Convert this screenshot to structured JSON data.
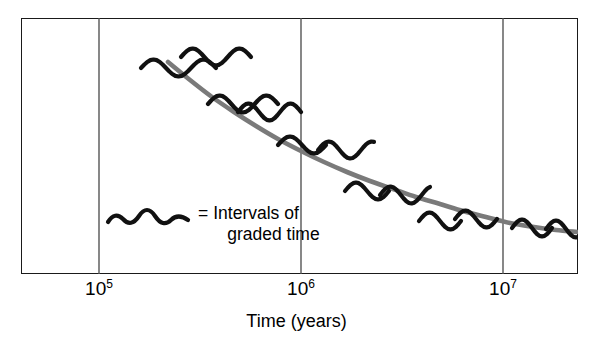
{
  "figure": {
    "background_color": "#ffffff",
    "frame_color": "#1a1a1a",
    "gridline_color": "#555555",
    "curve_color": "#7a7a7a",
    "squiggle_color": "#111111"
  },
  "axis": {
    "title": "Time (years)",
    "ticks": [
      {
        "mantissa": "10",
        "exponent": "5",
        "value": 100000,
        "x_px": 99
      },
      {
        "mantissa": "10",
        "exponent": "6",
        "value": 1000000,
        "x_px": 301
      },
      {
        "mantissa": "10",
        "exponent": "7",
        "value": 10000000,
        "x_px": 503
      }
    ]
  },
  "legend": {
    "equals": "=",
    "line1": "Intervals of",
    "line2": "graded time",
    "symbol_name": "wavy-squiggle"
  },
  "chart_data": {
    "type": "line",
    "title": "",
    "xlabel": "Time (years)",
    "ylabel": "",
    "x_scale": "log",
    "xlim": [
      30000,
      30000000
    ],
    "ylim": [
      0,
      1
    ],
    "grid": true,
    "gridlines_x": [
      100000,
      1000000,
      10000000
    ],
    "legend_position": "inside-lower-left",
    "series": [
      {
        "name": "rate-decay-curve",
        "color": "#7a7a7a",
        "points_px": [
          [
            168,
            62
          ],
          [
            190,
            80
          ],
          [
            212,
            97
          ],
          [
            234,
            112
          ],
          [
            256,
            126
          ],
          [
            278,
            139
          ],
          [
            301,
            151
          ],
          [
            324,
            162
          ],
          [
            347,
            172
          ],
          [
            370,
            181
          ],
          [
            393,
            189
          ],
          [
            416,
            197
          ],
          [
            440,
            204
          ],
          [
            463,
            211
          ],
          [
            486,
            217
          ],
          [
            510,
            223
          ],
          [
            534,
            227
          ],
          [
            556,
            230
          ],
          [
            577,
            232
          ]
        ]
      }
    ],
    "annotations": [
      {
        "name": "squiggle-1",
        "x_px": 141,
        "y_px": 68,
        "width_px": 75,
        "cycles": 1.5
      },
      {
        "name": "squiggle-2",
        "x_px": 181,
        "y_px": 57,
        "width_px": 70,
        "cycles": 1.5
      },
      {
        "name": "squiggle-3",
        "x_px": 208,
        "y_px": 104,
        "width_px": 70,
        "cycles": 1.5
      },
      {
        "name": "squiggle-4",
        "x_px": 238,
        "y_px": 112,
        "width_px": 63,
        "cycles": 1.5
      },
      {
        "name": "squiggle-5",
        "x_px": 278,
        "y_px": 145,
        "width_px": 48,
        "cycles": 1.0
      },
      {
        "name": "squiggle-6",
        "x_px": 318,
        "y_px": 150,
        "width_px": 56,
        "cycles": 1.3
      },
      {
        "name": "squiggle-7",
        "x_px": 345,
        "y_px": 191,
        "width_px": 44,
        "cycles": 1.0
      },
      {
        "name": "squiggle-8",
        "x_px": 380,
        "y_px": 195,
        "width_px": 50,
        "cycles": 1.2
      },
      {
        "name": "squiggle-9",
        "x_px": 419,
        "y_px": 221,
        "width_px": 42,
        "cycles": 1.0
      },
      {
        "name": "squiggle-10",
        "x_px": 455,
        "y_px": 219,
        "width_px": 42,
        "cycles": 1.0
      },
      {
        "name": "squiggle-11",
        "x_px": 512,
        "y_px": 228,
        "width_px": 40,
        "cycles": 1.0
      },
      {
        "name": "squiggle-12",
        "x_px": 546,
        "y_px": 229,
        "width_px": 40,
        "cycles": 1.0
      }
    ]
  }
}
